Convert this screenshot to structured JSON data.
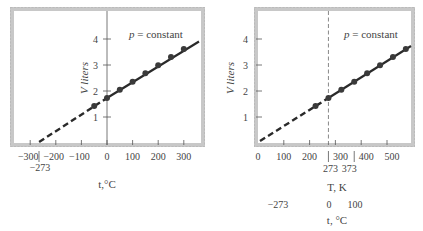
{
  "chart_data": [
    {
      "type": "line",
      "title": "",
      "annotation": "p = constant",
      "xlabel": "t, °C",
      "ylabel": "V liters",
      "xlim": [
        -330,
        350
      ],
      "ylim": [
        0,
        4.9
      ],
      "x_ticks": [
        -300,
        -200,
        -100,
        0,
        100,
        200,
        300
      ],
      "x_tick_labels": [
        "−300",
        "−200",
        "−100",
        "0",
        "100",
        "200",
        "300"
      ],
      "extra_x_marker": {
        "value": -273,
        "label": "−273"
      },
      "y_ticks": [
        1,
        2,
        3,
        4
      ],
      "y_tick_labels": [
        "1",
        "2",
        "3",
        "4"
      ],
      "grid": false,
      "series": [
        {
          "name": "measured",
          "style": "solid with markers",
          "x": [
            -50,
            0,
            50,
            100,
            150,
            200,
            250,
            300
          ],
          "y": [
            1.42,
            1.73,
            2.05,
            2.36,
            2.68,
            2.99,
            3.31,
            3.62
          ]
        },
        {
          "name": "extrapolation",
          "style": "dashed",
          "x": [
            -273,
            0
          ],
          "y": [
            0,
            1.73
          ]
        }
      ],
      "fit_line_end": {
        "x": 350,
        "y": 3.94
      }
    },
    {
      "type": "line",
      "title": "",
      "annotation": "p = constant",
      "xlabel": "T, K",
      "secondary_xlabel": "t, °C",
      "ylabel": "V liters",
      "xlim": [
        0,
        590
      ],
      "ylim": [
        0,
        4.9
      ],
      "x_ticks": [
        0,
        100,
        200,
        300,
        400,
        500
      ],
      "x_tick_labels": [
        "0",
        "100",
        "200",
        "300",
        "400",
        "500"
      ],
      "extra_x_markers": [
        {
          "value": 273,
          "label": "273",
          "celsius_label": "0"
        },
        {
          "value": 373,
          "label": "373",
          "celsius_label": "100"
        }
      ],
      "celsius_zero_label": "−273",
      "vertical_reference_line": {
        "x": 273,
        "style": "dashed"
      },
      "y_ticks": [
        1,
        2,
        3,
        4
      ],
      "y_tick_labels": [
        "1",
        "2",
        "3",
        "4"
      ],
      "grid": false,
      "series": [
        {
          "name": "measured",
          "style": "solid with markers",
          "x": [
            223,
            273,
            323,
            373,
            423,
            473,
            523,
            573
          ],
          "y": [
            1.42,
            1.73,
            2.05,
            2.36,
            2.68,
            2.99,
            3.31,
            3.62
          ]
        },
        {
          "name": "extrapolation",
          "style": "dashed",
          "x": [
            0,
            273
          ],
          "y": [
            0,
            1.73
          ]
        }
      ],
      "fit_line_end": {
        "x": 590,
        "y": 3.73
      }
    }
  ],
  "left": {
    "annotation": "p = constant",
    "ylabel": "V liters",
    "xlabel": "t,°C",
    "marker_label": "−273"
  },
  "right": {
    "annotation": "p = constant",
    "ylabel": "V liters",
    "xlabel": "T, K",
    "sub_labels": [
      "273",
      "373"
    ],
    "celsius_labels": [
      "−273",
      "0",
      "100"
    ],
    "celsius_title": "t, °C"
  },
  "colors": {
    "frame": "#c8c8c8",
    "line": "#2a2a2a",
    "marker": "#3a3a3a",
    "axis": "#555555",
    "text": "#444444"
  }
}
